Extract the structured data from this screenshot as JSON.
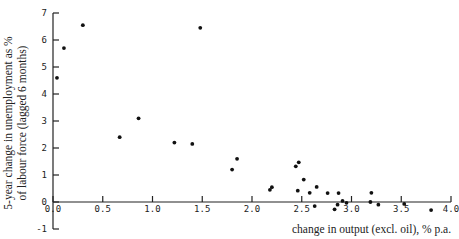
{
  "chart_data": {
    "type": "scatter",
    "title": "",
    "xlabel": "change in output (excl. oil), % p.a.",
    "ylabel_line1": "5-year change in unemployment as %",
    "ylabel_line2": "of labour force (lagged 6 months)",
    "xlim": [
      0,
      4
    ],
    "ylim": [
      -1,
      7
    ],
    "x_ticks": [
      "0.0",
      "0.5",
      "1.0",
      "1.5",
      "2.0",
      "2.5",
      "3.0",
      "3.5",
      "4.0"
    ],
    "y_ticks": [
      "-1",
      "0",
      "1",
      "2",
      "3",
      "4",
      "5",
      "6",
      "7"
    ],
    "grid": false,
    "legend": null,
    "points": [
      {
        "x": 0.04,
        "y": 4.6
      },
      {
        "x": 0.11,
        "y": 5.7
      },
      {
        "x": 0.3,
        "y": 6.55
      },
      {
        "x": 1.48,
        "y": 6.45
      },
      {
        "x": 0.67,
        "y": 2.4
      },
      {
        "x": 0.86,
        "y": 3.1
      },
      {
        "x": 1.22,
        "y": 2.2
      },
      {
        "x": 1.4,
        "y": 2.15
      },
      {
        "x": 1.8,
        "y": 1.2
      },
      {
        "x": 1.85,
        "y": 1.6
      },
      {
        "x": 2.18,
        "y": 0.45
      },
      {
        "x": 2.2,
        "y": 0.55
      },
      {
        "x": 2.44,
        "y": 1.32
      },
      {
        "x": 2.47,
        "y": 1.47
      },
      {
        "x": 2.52,
        "y": 0.83
      },
      {
        "x": 2.46,
        "y": 0.42
      },
      {
        "x": 2.58,
        "y": 0.34
      },
      {
        "x": 2.65,
        "y": 0.56
      },
      {
        "x": 2.63,
        "y": -0.15
      },
      {
        "x": 2.76,
        "y": 0.33
      },
      {
        "x": 2.87,
        "y": 0.33
      },
      {
        "x": 2.83,
        "y": -0.27
      },
      {
        "x": 2.86,
        "y": -0.1
      },
      {
        "x": 2.91,
        "y": 0.04
      },
      {
        "x": 2.95,
        "y": -0.03
      },
      {
        "x": 3.2,
        "y": 0.34
      },
      {
        "x": 3.19,
        "y": 0.0
      },
      {
        "x": 3.27,
        "y": -0.1
      },
      {
        "x": 3.53,
        "y": -0.07
      },
      {
        "x": 3.8,
        "y": -0.3
      }
    ]
  }
}
